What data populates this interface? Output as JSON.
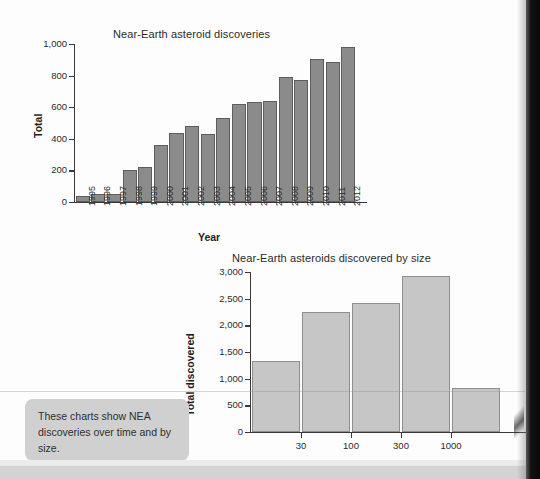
{
  "page": {
    "background_color": "#fdfdfd",
    "gutter_color": "#0a0a0a"
  },
  "caption": {
    "text": "These charts show NEA discoveries over time and by size.",
    "background_color": "#d0d0d0"
  },
  "chart_data": [
    {
      "id": "discoveries-over-time",
      "type": "bar",
      "title": "Near-Earth asteroid discoveries",
      "xlabel": "Year",
      "ylabel": "Total",
      "ylim": [
        0,
        1000
      ],
      "yticks": [
        0,
        200,
        400,
        600,
        800,
        1000
      ],
      "ytick_labels": [
        "0",
        "200",
        "400",
        "600",
        "800",
        "1,000"
      ],
      "grid": false,
      "legend": "none",
      "bar_color": "#8b8b8b",
      "bar_edge_color": "#5e5e5e",
      "categories": [
        "1995",
        "1996",
        "1997",
        "1998",
        "1999",
        "2000",
        "2001",
        "2002",
        "2003",
        "2004",
        "2005",
        "2006",
        "2007",
        "2008",
        "2009",
        "2010",
        "2011",
        "2012"
      ],
      "values": [
        35,
        48,
        52,
        202,
        224,
        362,
        437,
        480,
        430,
        532,
        620,
        632,
        641,
        794,
        770,
        906,
        888,
        983
      ]
    },
    {
      "id": "discovered-by-size",
      "type": "bar",
      "title": "Near-Earth asteroids discovered by size",
      "xlabel": "Estimated diameter (m)",
      "ylabel": "Total discovered",
      "ylim": [
        0,
        3000
      ],
      "yticks": [
        0,
        500,
        1000,
        1500,
        2000,
        2500,
        3000
      ],
      "ytick_labels": [
        "0",
        "500",
        "1,000",
        "1,500",
        "2,000",
        "2,500",
        "3,000"
      ],
      "grid": false,
      "legend": "none",
      "bar_color": "#c6c6c6",
      "bar_edge_color": "#8f8f8f",
      "xticks": [
        "30",
        "100",
        "300",
        "1000"
      ],
      "categories": [
        "<30",
        "30-100",
        "100-300",
        "300-1000",
        ">1000"
      ],
      "values": [
        1325,
        2250,
        2420,
        2930,
        830
      ]
    }
  ]
}
